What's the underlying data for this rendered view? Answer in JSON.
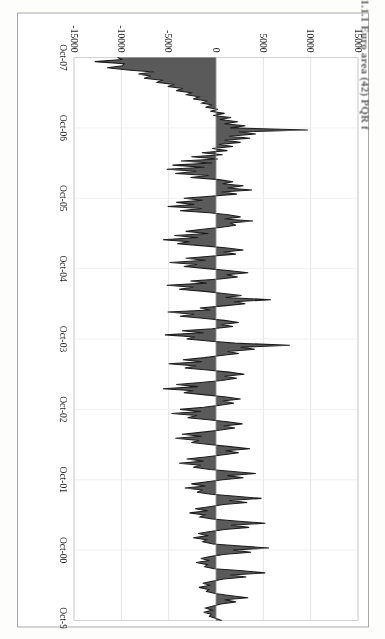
{
  "document": {
    "type": "scanned-figure-page",
    "caption_fragment": "1.1.1 Euro area (42) PQR f"
  },
  "figure": {
    "orientation": "rotated-90-cw",
    "frame_border_color": "#a8a8a8",
    "plot_background": "#ffffff",
    "gridline_color": "#e2e2e2",
    "series_fill_color": "#5a5a5a",
    "series_line_color": "#1c1c1c"
  },
  "chart_data": {
    "type": "area",
    "title": "",
    "subtitle": "",
    "xlabel": "",
    "ylabel": "",
    "grid": true,
    "legend_position": "none",
    "orientation": "horizontal-rotated",
    "ylim": [
      -15000,
      15000
    ],
    "ytick_labels": [
      "15000",
      "10000",
      "5000",
      "0",
      "-5000",
      "-10000",
      "-15000"
    ],
    "ytick_values": [
      15000,
      10000,
      5000,
      0,
      -5000,
      -10000,
      -15000
    ],
    "xtick_labels": [
      "Oct-07",
      "Oct-06",
      "Oct-05",
      "Oct-04",
      "Oct-03",
      "Oct-02",
      "Oct-01",
      "Oct-00",
      "Oct-99"
    ],
    "x_order": "newest-at-left",
    "series": [
      {
        "name": "Net flow",
        "values": [
          -10400,
          -9900,
          -12800,
          -9700,
          -9900,
          -11500,
          -9300,
          -6600,
          -8200,
          -6900,
          -7600,
          -5700,
          -6200,
          -4400,
          -5100,
          -3500,
          -4200,
          -2600,
          -3100,
          -1800,
          -2400,
          -900,
          -1500,
          -400,
          -1100,
          200,
          -600,
          900,
          -300,
          1600,
          400,
          2300,
          900,
          3100,
          1500,
          9700,
          2400,
          4200,
          1400,
          3600,
          900,
          2600,
          300,
          1800,
          -400,
          1200,
          -1500,
          700,
          -2600,
          200,
          -3700,
          -400,
          -4600,
          -1200,
          -5200,
          -2100,
          -4300,
          -800,
          -2700,
          300,
          1800,
          700,
          2900,
          1200,
          3800,
          600,
          2200,
          -600,
          -3400,
          -1400,
          -4200,
          -2300,
          -5100,
          -1500,
          -3800,
          -700,
          1300,
          2600,
          900,
          3900,
          1500,
          2100,
          600,
          -1400,
          -3200,
          -800,
          -4400,
          -1900,
          -5600,
          -2800,
          -4100,
          -1300,
          1200,
          2900,
          800,
          2100,
          -600,
          -3200,
          -1100,
          -4900,
          -2000,
          -3400,
          -900,
          1500,
          3400,
          1100,
          2300,
          400,
          -2700,
          -1000,
          -5200,
          -2400,
          -3900,
          -1200,
          800,
          2700,
          1000,
          5800,
          1900,
          3100,
          800,
          -1700,
          -600,
          -5100,
          -2300,
          -3800,
          -1400,
          900,
          2400,
          600,
          1800,
          -400,
          -3600,
          -1300,
          -5400,
          -2200,
          -3100,
          -800,
          2000,
          7800,
          2600,
          4100,
          1200,
          2400,
          500,
          -1200,
          -3500,
          -1500,
          -5000,
          -2100,
          -3300,
          -900,
          1400,
          3000,
          900,
          2200,
          600,
          -1600,
          -4200,
          -1900,
          -5600,
          -2400,
          -3400,
          -1100,
          1100,
          2600,
          700,
          1900,
          400,
          -1300,
          -3800,
          -1600,
          -4700,
          -2000,
          -3000,
          -800,
          1200,
          2800,
          800,
          2000,
          500,
          -1400,
          -3600,
          -1500,
          -4300,
          -1800,
          -2600,
          -700,
          1500,
          3600,
          1000,
          2400,
          600,
          -1100,
          -3100,
          -1300,
          -3900,
          -1600,
          -2400,
          -600,
          1800,
          4200,
          1200,
          2900,
          700,
          -900,
          -2600,
          -1100,
          -3300,
          -1400,
          -2000,
          -500,
          2100,
          4800,
          1400,
          3300,
          800,
          -700,
          -2200,
          -900,
          -2800,
          -1200,
          -1700,
          -400,
          2400,
          5200,
          1600,
          3500,
          900,
          -600,
          -1900,
          -800,
          -2400,
          -1000,
          -1400,
          -300,
          2600,
          5600,
          1800,
          3700,
          1000,
          -500,
          -1600,
          -700,
          -2100,
          -900,
          -1200,
          -200,
          2800,
          5200,
          1500,
          3200,
          800,
          -400,
          -1400,
          -600,
          -1800,
          -800,
          -1000,
          -100,
          1600,
          3400,
          900,
          2100,
          500,
          -300,
          -1100,
          -400,
          -1300,
          -500,
          -700,
          0,
          600
        ]
      }
    ]
  }
}
